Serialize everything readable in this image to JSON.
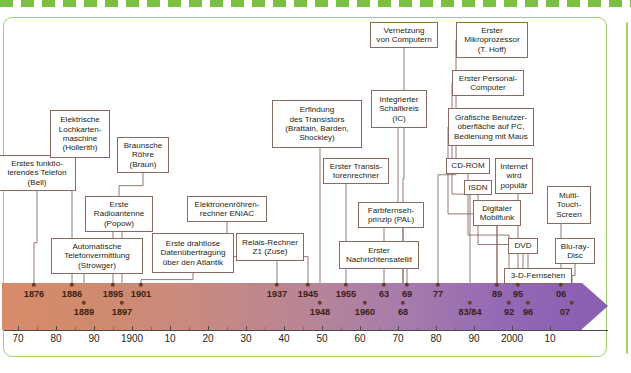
{
  "frame": {
    "accent_color": "#9ed36a",
    "box_border_color": "#8a6a63",
    "dot_color": "#6b3a2a",
    "bar_start_color": "#d98c6a",
    "bar_end_color": "#8b5fb2"
  },
  "events": [
    {
      "id": "telefon",
      "label": "Erstes funktio-\nierendes Telefon\n(Bell)",
      "year_label": "1876",
      "year": 1876,
      "x": -2,
      "y": 155,
      "w": 78,
      "h": 36,
      "row": 1
    },
    {
      "id": "lochkarten",
      "label": "Elektrische\nLochkarten-\nmaschine\n(Hollerith)",
      "year_label": "1886",
      "year": 1886,
      "x": 50,
      "y": 110,
      "w": 60,
      "h": 48,
      "row": 1
    },
    {
      "id": "braunsche",
      "label": "Braunsche\nRöhre\n(Braun)",
      "year_label": "1897",
      "year": 1897,
      "x": 117,
      "y": 137,
      "w": 52,
      "h": 36,
      "row": 2
    },
    {
      "id": "radioantenne",
      "label": "Erste\nRadioantenne\n(Popow)",
      "year_label": "1895",
      "year": 1895,
      "x": 85,
      "y": 196,
      "w": 68,
      "h": 36,
      "row": 1
    },
    {
      "id": "telefonvermitt",
      "label": "Automatische\nTelefonvermittlung\n(Strowger)",
      "year_label": "1889",
      "year": 1889,
      "x": 51,
      "y": 238,
      "w": 92,
      "h": 36,
      "row": 2
    },
    {
      "id": "drahtlos",
      "label": "Erste drahtlose\nDatenübertragung\nüber den Atlantik",
      "year_label": "1901",
      "year": 1901,
      "x": 152,
      "y": 233,
      "w": 82,
      "h": 40,
      "row": 1
    },
    {
      "id": "eniac",
      "label": "Elektronenröhren-\nrechner ENIAC",
      "year_label": "1945",
      "year": 1945,
      "x": 187,
      "y": 196,
      "w": 80,
      "h": 26,
      "row": 1
    },
    {
      "id": "z1",
      "label": "Relais-Rechner\nZ1 (Zuse)",
      "year_label": "1937",
      "year": 1937,
      "x": 236,
      "y": 233,
      "w": 68,
      "h": 28,
      "row": 1
    },
    {
      "id": "transistor",
      "label": "Erfindung\ndes Transistors\n(Brattain, Barden,\nShockley)",
      "year_label": "1948",
      "year": 1948,
      "x": 272,
      "y": 100,
      "w": 90,
      "h": 48,
      "row": 2
    },
    {
      "id": "transrechner",
      "label": "Erster Transis-\ntorenrechner",
      "year_label": "1955",
      "year": 1955,
      "x": 323,
      "y": 158,
      "w": 66,
      "h": 26,
      "row": 1
    },
    {
      "id": "ic",
      "label": "Integrierter\nSchaltkreis\n(IC)",
      "year_label": "1960",
      "year": 1960,
      "x": 371,
      "y": 90,
      "w": 56,
      "h": 38,
      "row": 2
    },
    {
      "id": "pal",
      "label": "Farbfernseh-\nprinzip (PAL)",
      "year_label": "63",
      "year": 1963,
      "x": 358,
      "y": 202,
      "w": 66,
      "h": 26,
      "row": 1
    },
    {
      "id": "satellit",
      "label": "Erster\nNachrichtensatellit",
      "year_label": "69",
      "year": 1969,
      "x": 339,
      "y": 241,
      "w": 80,
      "h": 28,
      "row": 1
    },
    {
      "id": "vernetzung",
      "label": "Vernetzung\nvon Computern",
      "year_label": "68",
      "year": 1968,
      "x": 370,
      "y": 22,
      "w": 68,
      "h": 26,
      "row": 2
    },
    {
      "id": "mikroprozessor",
      "label": "Erster\nMikroprozessor\n(T. Hoff)",
      "year_label": "77",
      "year": 1977,
      "x": 456,
      "y": 22,
      "w": 72,
      "h": 36,
      "row": 1
    },
    {
      "id": "pc",
      "label": "Erster Personal-\nComputer",
      "year_label": "83/84",
      "year": 1983,
      "x": 452,
      "y": 70,
      "w": 72,
      "h": 26,
      "row": 2
    },
    {
      "id": "gui",
      "label": "Grafische Benutzer-\noberfläche auf PC,\nBedienung mit Maus",
      "year_label": "89",
      "year": 1989,
      "x": 448,
      "y": 108,
      "w": 86,
      "h": 38,
      "row": 1
    },
    {
      "id": "cdrom",
      "label": "CD-ROM",
      "year_label": "92",
      "year": 1992,
      "x": 446,
      "y": 158,
      "w": 44,
      "h": 16,
      "row": 2
    },
    {
      "id": "internet",
      "label": "Internet\nwird\npopulär",
      "year_label": "95",
      "year": 1995,
      "x": 495,
      "y": 158,
      "w": 38,
      "h": 36,
      "row": 1
    },
    {
      "id": "isdn",
      "label": "ISDN",
      "year_label": "96",
      "year": 1996,
      "x": 464,
      "y": 180,
      "w": 28,
      "h": 15,
      "row": 2
    },
    {
      "id": "mobilfunk",
      "label": "Digitaler\nMobilfunk",
      "year_label": "06",
      "year": 2006,
      "x": 473,
      "y": 200,
      "w": 48,
      "h": 26,
      "row": 1
    },
    {
      "id": "multitouch",
      "label": "Multi-\nTouch-\nScreen",
      "year_label": "07",
      "year": 2007,
      "x": 547,
      "y": 186,
      "w": 44,
      "h": 38,
      "row": 1
    },
    {
      "id": "dvd",
      "label": "DVD",
      "year_label": "",
      "year": 0,
      "x": 508,
      "y": 238,
      "w": 30,
      "h": 16,
      "row": 0
    },
    {
      "id": "bluray",
      "label": "Blu-ray-\nDisc",
      "year_label": "",
      "year": 0,
      "x": 555,
      "y": 238,
      "w": 40,
      "h": 26,
      "row": 0
    },
    {
      "id": "tv3d",
      "label": "3-D-Fernsehen",
      "year_label": "",
      "year": 0,
      "x": 504,
      "y": 268,
      "w": 68,
      "h": 16,
      "row": 0
    }
  ],
  "year_markers": [
    {
      "label": "1876",
      "x": 34,
      "row": 1
    },
    {
      "label": "1886",
      "x": 72,
      "row": 1
    },
    {
      "label": "1889",
      "x": 84,
      "row": 2
    },
    {
      "label": "1895",
      "x": 113,
      "row": 1
    },
    {
      "label": "1897",
      "x": 122,
      "row": 2
    },
    {
      "label": "1901",
      "x": 141,
      "row": 1
    },
    {
      "label": "1937",
      "x": 277,
      "row": 1
    },
    {
      "label": "1945",
      "x": 308,
      "row": 1
    },
    {
      "label": "1948",
      "x": 320,
      "row": 2
    },
    {
      "label": "1955",
      "x": 346,
      "row": 1
    },
    {
      "label": "1960",
      "x": 365,
      "row": 2
    },
    {
      "label": "63",
      "x": 384,
      "row": 1
    },
    {
      "label": "68",
      "x": 403,
      "row": 2
    },
    {
      "label": "69",
      "x": 407,
      "row": 1
    },
    {
      "label": "77",
      "x": 438,
      "row": 1
    },
    {
      "label": "83/84",
      "x": 470,
      "row": 2
    },
    {
      "label": "89",
      "x": 497,
      "row": 1
    },
    {
      "label": "92",
      "x": 509,
      "row": 2
    },
    {
      "label": "95",
      "x": 518,
      "row": 1
    },
    {
      "label": "96",
      "x": 528,
      "row": 2
    },
    {
      "label": "06",
      "x": 561,
      "row": 1
    },
    {
      "label": "07",
      "x": 565,
      "row": 2
    }
  ],
  "dots": [
    {
      "x": 34,
      "row": 1
    },
    {
      "x": 72,
      "row": 1
    },
    {
      "x": 84,
      "row": 2
    },
    {
      "x": 113,
      "row": 1
    },
    {
      "x": 122,
      "row": 2
    },
    {
      "x": 141,
      "row": 1
    },
    {
      "x": 277,
      "row": 1
    },
    {
      "x": 308,
      "row": 1
    },
    {
      "x": 320,
      "row": 2
    },
    {
      "x": 346,
      "row": 1
    },
    {
      "x": 365,
      "row": 2
    },
    {
      "x": 384,
      "row": 1
    },
    {
      "x": 403,
      "row": 2
    },
    {
      "x": 407,
      "row": 1
    },
    {
      "x": 438,
      "row": 1
    },
    {
      "x": 470,
      "row": 2
    },
    {
      "x": 497,
      "row": 1
    },
    {
      "x": 509,
      "row": 2
    },
    {
      "x": 518,
      "row": 1
    },
    {
      "x": 528,
      "row": 2
    },
    {
      "x": 561,
      "row": 1
    },
    {
      "x": 572,
      "row": 2
    }
  ],
  "axis": {
    "ticks": [
      {
        "label": "70",
        "x": 18
      },
      {
        "label": "80",
        "x": 56
      },
      {
        "label": "90",
        "x": 94
      },
      {
        "label": "1900",
        "x": 132
      },
      {
        "label": "10",
        "x": 170
      },
      {
        "label": "20",
        "x": 208
      },
      {
        "label": "30",
        "x": 246
      },
      {
        "label": "40",
        "x": 284
      },
      {
        "label": "50",
        "x": 322
      },
      {
        "label": "60",
        "x": 360
      },
      {
        "label": "70",
        "x": 398
      },
      {
        "label": "80",
        "x": 436
      },
      {
        "label": "90",
        "x": 474
      },
      {
        "label": "2000",
        "x": 512
      },
      {
        "label": "10",
        "x": 550
      }
    ]
  },
  "connectors": [
    {
      "from": "telefon",
      "x1": 37,
      "y1": 191,
      "x2": 34,
      "y2": 285
    },
    {
      "from": "lochkarten",
      "x1": 72,
      "y1": 158,
      "x2": 72,
      "y2": 285
    },
    {
      "from": "braunsche",
      "x1": 143,
      "y1": 173,
      "x2": 119,
      "y2": 196
    },
    {
      "from": "radioantenne",
      "x1": 113,
      "y1": 232,
      "x2": 113,
      "y2": 285
    },
    {
      "from": "radioantenne2",
      "x1": 122,
      "y1": 232,
      "x2": 122,
      "y2": 285
    },
    {
      "from": "telefonvermitt",
      "x1": 84,
      "y1": 274,
      "x2": 84,
      "y2": 285
    },
    {
      "from": "drahtlos",
      "x1": 193,
      "y1": 273,
      "x2": 141,
      "y2": 285
    },
    {
      "from": "eniac",
      "x1": 227,
      "y1": 222,
      "x2": 308,
      "y2": 285
    },
    {
      "from": "z1",
      "x1": 277,
      "y1": 261,
      "x2": 277,
      "y2": 285
    },
    {
      "from": "transistor",
      "x1": 320,
      "y1": 148,
      "x2": 320,
      "y2": 285
    },
    {
      "from": "transrechner",
      "x1": 346,
      "y1": 184,
      "x2": 346,
      "y2": 285
    },
    {
      "from": "ic",
      "x1": 398,
      "y1": 128,
      "x2": 403,
      "y2": 285
    },
    {
      "from": "pal",
      "x1": 384,
      "y1": 228,
      "x2": 384,
      "y2": 285
    },
    {
      "from": "satellit",
      "x1": 407,
      "y1": 269,
      "x2": 407,
      "y2": 285
    },
    {
      "from": "vernetzung",
      "x1": 404,
      "y1": 48,
      "x2": 403,
      "y2": 285
    },
    {
      "from": "mikroprozessor",
      "x1": 456,
      "y1": 40,
      "x2": 438,
      "y2": 285
    },
    {
      "from": "pc",
      "x1": 452,
      "y1": 83,
      "x2": 470,
      "y2": 285
    },
    {
      "from": "gui",
      "x1": 448,
      "y1": 127,
      "x2": 497,
      "y2": 285
    },
    {
      "from": "cdrom",
      "x1": 468,
      "y1": 174,
      "x2": 509,
      "y2": 285
    },
    {
      "from": "internet",
      "x1": 518,
      "y1": 194,
      "x2": 518,
      "y2": 285
    },
    {
      "from": "isdn",
      "x1": 478,
      "y1": 195,
      "x2": 528,
      "y2": 285
    },
    {
      "from": "mobilfunk",
      "x1": 497,
      "y1": 226,
      "x2": 497,
      "y2": 285
    },
    {
      "from": "multitouch",
      "x1": 561,
      "y1": 224,
      "x2": 561,
      "y2": 285
    },
    {
      "from": "dvd",
      "x1": 523,
      "y1": 254,
      "x2": 523,
      "y2": 285
    },
    {
      "from": "bluray",
      "x1": 575,
      "y1": 264,
      "x2": 572,
      "y2": 285
    },
    {
      "from": "tv3d",
      "x1": 538,
      "y1": 284,
      "x2": 538,
      "y2": 285
    }
  ]
}
